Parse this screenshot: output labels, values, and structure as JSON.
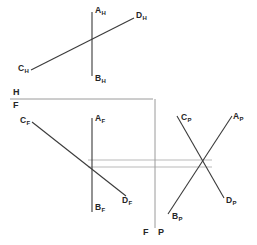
{
  "diagram": {
    "stroke_color": "#3a3a3a",
    "projection_color": "#b9b9b9",
    "fold_color": "#9a9a9a",
    "background": "#ffffff",
    "views": {
      "top": {
        "name": "horizontal-view",
        "labels": [
          {
            "id": "AH",
            "base": "A",
            "sub": "H",
            "x": 95,
            "y": 6
          },
          {
            "id": "DH",
            "base": "D",
            "sub": "H",
            "x": 136,
            "y": 11
          },
          {
            "id": "CH",
            "base": "C",
            "sub": "H",
            "x": 18,
            "y": 64
          },
          {
            "id": "BH",
            "base": "B",
            "sub": "H",
            "x": 95,
            "y": 74
          }
        ],
        "segments": [
          {
            "name": "line-AB-top",
            "x1": 92,
            "y1": 12,
            "x2": 92,
            "y2": 76
          },
          {
            "name": "line-CD-top",
            "x1": 31,
            "y1": 70,
            "x2": 134,
            "y2": 18
          }
        ]
      },
      "front": {
        "name": "frontal-view",
        "labels": [
          {
            "id": "CF",
            "base": "C",
            "sub": "F",
            "x": 20,
            "y": 116
          },
          {
            "id": "AF",
            "base": "A",
            "sub": "F",
            "x": 95,
            "y": 114
          },
          {
            "id": "DF",
            "base": "D",
            "sub": "F",
            "x": 122,
            "y": 196
          },
          {
            "id": "BF",
            "base": "B",
            "sub": "F",
            "x": 95,
            "y": 203
          }
        ],
        "segments": [
          {
            "name": "line-AB-front",
            "x1": 92,
            "y1": 118,
            "x2": 92,
            "y2": 212
          },
          {
            "name": "line-CD-front",
            "x1": 32,
            "y1": 122,
            "x2": 126,
            "y2": 196
          }
        ]
      },
      "profile": {
        "name": "profile-view",
        "labels": [
          {
            "id": "CP",
            "base": "C",
            "sub": "P",
            "x": 181,
            "y": 113
          },
          {
            "id": "AP",
            "base": "A",
            "sub": "P",
            "x": 233,
            "y": 112
          },
          {
            "id": "DP",
            "base": "D",
            "sub": "P",
            "x": 226,
            "y": 196
          },
          {
            "id": "BP",
            "base": "B",
            "sub": "P",
            "x": 172,
            "y": 212
          }
        ],
        "segments": [
          {
            "name": "line-CD-profile",
            "x1": 177,
            "y1": 116,
            "x2": 224,
            "y2": 198
          },
          {
            "name": "line-AB-profile",
            "x1": 168,
            "y1": 214,
            "x2": 232,
            "y2": 116
          }
        ]
      }
    },
    "fold_lines": {
      "hf": {
        "name": "fold-line-hf",
        "x1": 10,
        "y1": 99,
        "x2": 152,
        "y2": 99,
        "label_top": "H",
        "label_bottom": "F",
        "label_top_x": 13,
        "label_top_y": 88,
        "label_bottom_x": 13,
        "label_bottom_y": 101
      },
      "fp": {
        "name": "fold-line-fp",
        "x1": 155,
        "y1": 99,
        "x2": 155,
        "y2": 228,
        "label_left": "F",
        "label_right": "P",
        "label_left_x": 143,
        "label_left_y": 228,
        "label_right_x": 158,
        "label_right_y": 228
      }
    },
    "projection_lines": [
      {
        "name": "projector-upper",
        "x1": 88,
        "y1": 160,
        "x2": 212,
        "y2": 160
      },
      {
        "name": "projector-lower",
        "x1": 88,
        "y1": 167,
        "x2": 212,
        "y2": 167
      }
    ]
  }
}
